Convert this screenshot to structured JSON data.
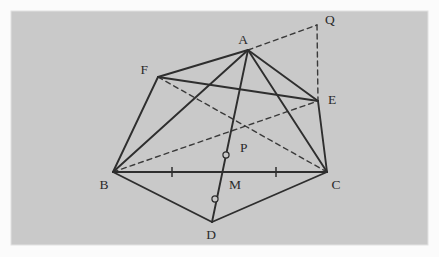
{
  "figure": {
    "canvas": {
      "width": 439,
      "height": 257
    },
    "panel": {
      "name": "diagram-panel",
      "x": 11,
      "y": 11,
      "width": 417,
      "height": 234,
      "fill": "#c9c9c9",
      "border_color": "#e2e2e2",
      "outer_background": "#fbfbfb"
    },
    "style": {
      "solid_color": "#2e2e2e",
      "solid_width": 1.9,
      "dashed_color": "#3a3a3a",
      "dashed_width": 1.4,
      "dash_pattern": "5,4",
      "label_color": "#2b2b2b",
      "label_size": 13.5,
      "marker_stroke": "#2e2e2e",
      "marker_radius": 3.1
    },
    "vertices": [
      {
        "id": "A",
        "label": "A",
        "x": 248,
        "y": 50,
        "label_x": 243,
        "label_y": 44,
        "label_anchor": "middle"
      },
      {
        "id": "B",
        "label": "B",
        "x": 113,
        "y": 172,
        "label_x": 104,
        "label_y": 189,
        "label_anchor": "middle"
      },
      {
        "id": "C",
        "label": "C",
        "x": 327,
        "y": 172,
        "label_x": 336,
        "label_y": 189,
        "label_anchor": "middle"
      },
      {
        "id": "D",
        "label": "D",
        "x": 212,
        "y": 222,
        "label_x": 211,
        "label_y": 239,
        "label_anchor": "middle"
      },
      {
        "id": "E",
        "label": "E",
        "x": 318,
        "y": 101,
        "label_x": 328,
        "label_y": 104,
        "label_anchor": "start"
      },
      {
        "id": "F",
        "label": "F",
        "x": 158,
        "y": 77,
        "label_x": 148,
        "label_y": 74,
        "label_anchor": "end"
      },
      {
        "id": "P",
        "label": "P",
        "x": 233,
        "y": 141,
        "label_x": 240,
        "label_y": 152,
        "label_anchor": "start"
      },
      {
        "id": "M",
        "label": "M",
        "x": 220,
        "y": 172,
        "label_x": 229,
        "label_y": 189,
        "label_anchor": "start"
      },
      {
        "id": "Q",
        "label": "Q",
        "x": 317,
        "y": 25,
        "label_x": 325,
        "label_y": 24,
        "label_anchor": "start"
      }
    ],
    "solid_edges": [
      {
        "name": "edge-A-F",
        "from": "A",
        "to": "F"
      },
      {
        "name": "edge-A-E",
        "from": "A",
        "to": "E"
      },
      {
        "name": "edge-A-B",
        "from": "A",
        "to": "B"
      },
      {
        "name": "edge-A-C",
        "from": "A",
        "to": "C"
      },
      {
        "name": "edge-F-E",
        "from": "F",
        "to": "E"
      },
      {
        "name": "edge-F-B",
        "from": "F",
        "to": "B"
      },
      {
        "name": "edge-E-C",
        "from": "E",
        "to": "C"
      },
      {
        "name": "edge-B-C",
        "from": "B",
        "to": "C"
      },
      {
        "name": "edge-B-D",
        "from": "B",
        "to": "D"
      },
      {
        "name": "edge-D-C",
        "from": "D",
        "to": "C"
      },
      {
        "name": "edge-A-D-through-P-M",
        "from": "A",
        "to": "D"
      }
    ],
    "dashed_edges": [
      {
        "name": "edge-F-C",
        "from": "F",
        "to": "C"
      },
      {
        "name": "edge-B-E",
        "from": "B",
        "to": "E"
      },
      {
        "name": "edge-A-Q",
        "from": "A",
        "to": "Q"
      },
      {
        "name": "edge-Q-E",
        "from": "Q",
        "to": "E"
      }
    ],
    "tick_marks": [
      {
        "name": "tick-BM-midpoint",
        "x": 172,
        "y": 172,
        "half_height": 5
      },
      {
        "name": "tick-MC-midpoint",
        "x": 276,
        "y": 172,
        "half_height": 5
      }
    ],
    "circle_markers": [
      {
        "name": "marker-PM-segment",
        "x": 226,
        "y": 155,
        "r": 3.1
      },
      {
        "name": "marker-MD-segment",
        "x": 215,
        "y": 199,
        "r": 3.1
      }
    ]
  }
}
